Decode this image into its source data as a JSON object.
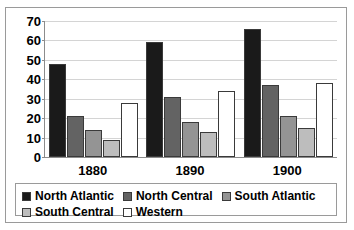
{
  "chart_data": {
    "type": "bar",
    "title": "",
    "subtitle": "",
    "xlabel": "",
    "ylabel": "",
    "categories": [
      "1880",
      "1890",
      "1900"
    ],
    "series": [
      {
        "name": "North Atlantic",
        "color": "#1a1a1a",
        "values": [
          48,
          59,
          66
        ]
      },
      {
        "name": "North Central",
        "color": "#636363",
        "values": [
          21,
          31,
          37
        ]
      },
      {
        "name": "South Atlantic",
        "color": "#949494",
        "values": [
          14,
          18,
          21
        ]
      },
      {
        "name": "South Central",
        "color": "#bdbdbd",
        "values": [
          9,
          13,
          15
        ]
      },
      {
        "name": "Western",
        "color": "#ffffff",
        "values": [
          28,
          34,
          38
        ]
      }
    ],
    "ylim": [
      0,
      70
    ],
    "yticks": [
      0,
      10,
      20,
      30,
      40,
      50,
      60,
      70
    ],
    "ytick_labels": [
      "0",
      "10",
      "20",
      "30",
      "40",
      "50",
      "60",
      "70"
    ],
    "grid": true,
    "grid_color": "#d4d4d4",
    "legend_position": "bottom",
    "axis_color": "#8c8c8c",
    "bar_border_color": "#3a3a3a",
    "plot_background": "#ffffff",
    "frame_border_color": "#9a9a9a"
  }
}
